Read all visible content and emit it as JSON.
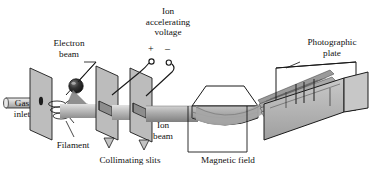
{
  "figure": {
    "type": "labeled-diagram"
  },
  "labels": {
    "gas_inlet_line1": "Gas",
    "gas_inlet_line2": "inlet",
    "electron_beam_line1": "Electron",
    "electron_beam_line2": "beam",
    "filament": "Filament",
    "collimating_slits": "Collimating slits",
    "ion_accel_line1": "Ion",
    "ion_accel_line2": "accelerating",
    "ion_accel_line3": "voltage",
    "plus_sign": "+",
    "minus_sign": "–",
    "ion_beam_line1": "Ion",
    "ion_beam_line2": "beam",
    "magnetic_field": "Magnetic field",
    "photographic_plate_line1": "Photographic",
    "photographic_plate_line2": "plate"
  },
  "icons": {
    "gas_inlet": "tube-icon",
    "electron_gun": "sphere-icon",
    "filament": "coil-icon",
    "slit_plate": "plate-icon",
    "magnet": "magnet-icon",
    "photographic_plate": "plate-panel-icon",
    "electrode_terminal": "terminal-circle-icon"
  },
  "colors": {
    "outline": "#1a1a1a",
    "plate_face": "#b9b9b9",
    "plate_face_dark": "#9a9a9a",
    "beam_light": "#d6d6d6",
    "beam_mid": "#a8a8a8",
    "beam_dark": "#8c8c8c",
    "magnet_top": "#ffffff",
    "magnet_body": "#a5a5a5",
    "magnet_body_dark": "#8e8e8e",
    "electron_gun": "#2b2b2b",
    "background": "#ffffff"
  }
}
